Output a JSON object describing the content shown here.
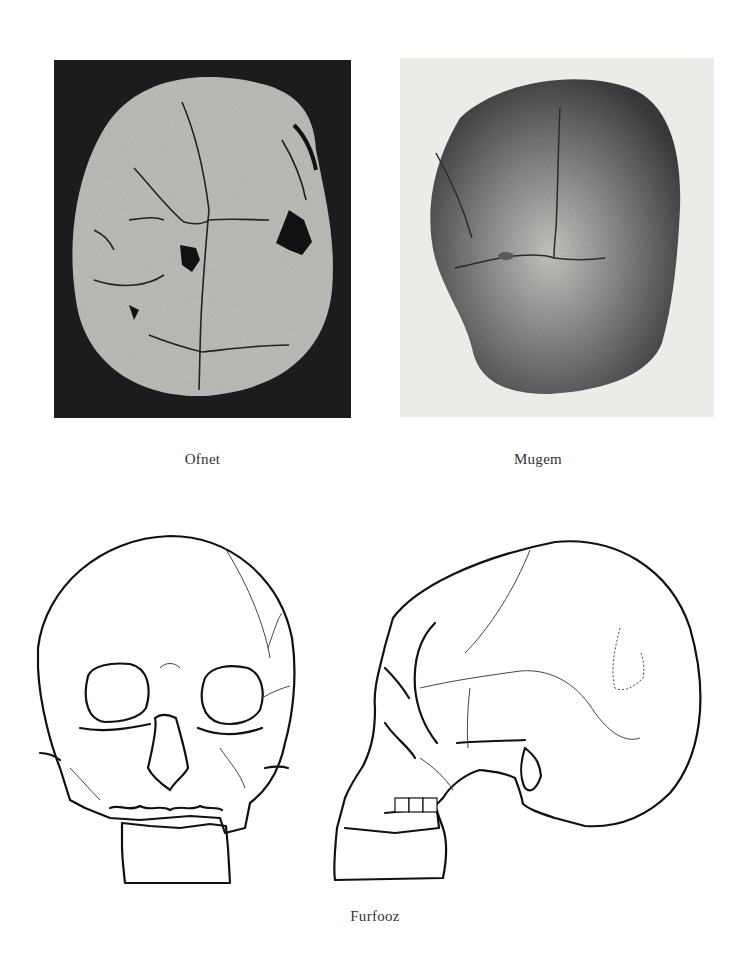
{
  "plate": {
    "figures": [
      {
        "id": "ofnet",
        "caption": "Ofnet",
        "type": "photograph",
        "view": "skull top view"
      },
      {
        "id": "mugem",
        "caption": "Mugem",
        "type": "photograph",
        "view": "skull top view"
      },
      {
        "id": "furfooz",
        "caption": "Furfooz",
        "type": "line drawing",
        "view": "skull front and side views"
      }
    ]
  }
}
